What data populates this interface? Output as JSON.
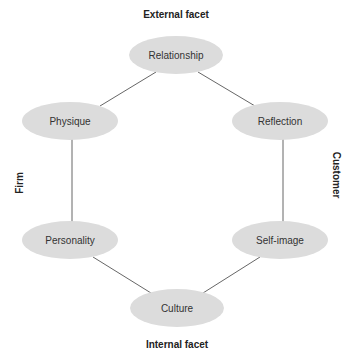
{
  "diagram": {
    "type": "hexagonal brand identity prism",
    "labels": {
      "top": "External facet",
      "bottom": "Internal facet",
      "left": "Firm",
      "right": "Customer"
    },
    "nodes": [
      {
        "id": "relationship",
        "label": "Relationship",
        "cx": 176,
        "cy": 55
      },
      {
        "id": "physique",
        "label": "Physique",
        "cx": 70,
        "cy": 121
      },
      {
        "id": "reflection",
        "label": "Reflection",
        "cx": 280,
        "cy": 121
      },
      {
        "id": "personality",
        "label": "Personality",
        "cx": 70,
        "cy": 240
      },
      {
        "id": "self-image",
        "label": "Self-image",
        "cx": 280,
        "cy": 240
      },
      {
        "id": "culture",
        "label": "Culture",
        "cx": 177,
        "cy": 308
      }
    ],
    "edges": [
      [
        "relationship",
        "physique"
      ],
      [
        "relationship",
        "reflection"
      ],
      [
        "physique",
        "personality"
      ],
      [
        "reflection",
        "self-image"
      ],
      [
        "personality",
        "culture"
      ],
      [
        "self-image",
        "culture"
      ]
    ],
    "colors": {
      "node_fill": "#dcdcdc",
      "edge": "#555555",
      "text": "#333333"
    }
  }
}
